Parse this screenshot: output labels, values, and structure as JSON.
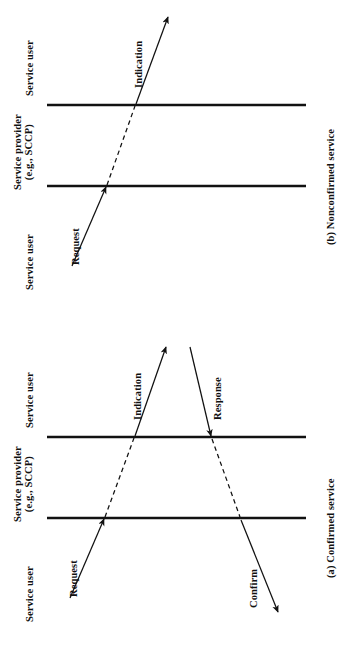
{
  "figure": {
    "background_color": "#ffffff",
    "ink_color": "#111111",
    "orientation": "rotated-90-ccw"
  },
  "diagrams": [
    {
      "id": "nonconfirmed",
      "caption": "(b) Nonconfirmed service",
      "lane_labels": {
        "top_user": "Service user",
        "provider_line1": "Service provider",
        "provider_line2": "(e.g., SCCP)",
        "bottom_user": "Service user"
      },
      "primitives": [
        {
          "name": "Request",
          "style": "solid-arrow"
        },
        {
          "name": "Indication",
          "style": "solid-arrow"
        }
      ]
    },
    {
      "id": "confirmed",
      "caption": "(a) Confirmed service",
      "lane_labels": {
        "top_user": "Service user",
        "provider_line1": "Service provider",
        "provider_line2": "(e.g., SCCP)",
        "bottom_user": "Service user"
      },
      "primitives": [
        {
          "name": "Request",
          "style": "solid-arrow"
        },
        {
          "name": "Indication",
          "style": "solid-arrow"
        },
        {
          "name": "Response",
          "style": "solid-arrow"
        },
        {
          "name": "Confirm",
          "style": "solid-arrow"
        }
      ]
    }
  ]
}
